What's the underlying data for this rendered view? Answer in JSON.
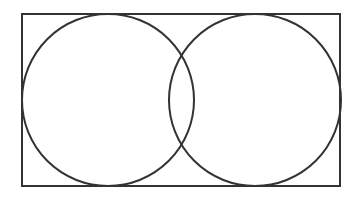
{
  "diagram": {
    "type": "venn",
    "stroke_color": "#333333",
    "background_color": "#ffffff",
    "universe": {
      "x": 22,
      "y": 14,
      "width": 318,
      "height": 172
    },
    "sets": [
      {
        "name": "left-circle",
        "cx": 108,
        "cy": 100,
        "r": 86
      },
      {
        "name": "right-circle",
        "cx": 255,
        "cy": 100,
        "r": 86
      }
    ]
  }
}
